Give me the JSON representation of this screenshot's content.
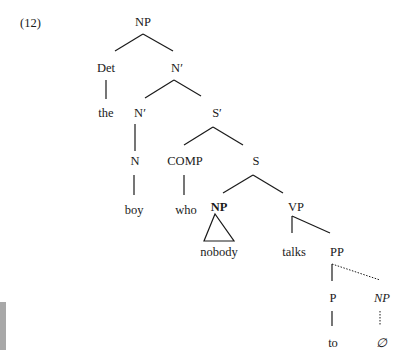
{
  "example_number": "(12)",
  "tree": {
    "root": "NP",
    "nodes": {
      "np_root": "NP",
      "det": "Det",
      "det_word": "the",
      "nbar_top": "N′",
      "nbar_low": "N′",
      "sbar": "S′",
      "n": "N",
      "n_word": "boy",
      "comp": "COMP",
      "comp_word": "who",
      "s": "S",
      "np_subj": "NP",
      "np_subj_word": "nobody",
      "vp": "VP",
      "v_word": "talks",
      "pp": "PP",
      "p": "P",
      "p_word": "to",
      "np_gap": "NP",
      "np_gap_word": "∅"
    },
    "edges": [
      [
        "NP",
        "Det"
      ],
      [
        "NP",
        "N′"
      ],
      [
        "Det",
        "the"
      ],
      [
        "N′",
        "N′"
      ],
      [
        "N′",
        "S′"
      ],
      [
        "N′",
        "N"
      ],
      [
        "N",
        "boy"
      ],
      [
        "S′",
        "COMP"
      ],
      [
        "S′",
        "S"
      ],
      [
        "COMP",
        "who"
      ],
      [
        "S",
        "NP"
      ],
      [
        "S",
        "VP"
      ],
      [
        "NP",
        "nobody (triangle)"
      ],
      [
        "VP",
        "talks"
      ],
      [
        "VP",
        "PP"
      ],
      [
        "PP",
        "P"
      ],
      [
        "PP",
        "NP (dotted)"
      ],
      [
        "P",
        "to"
      ],
      [
        "NP",
        "∅ (dotted)"
      ]
    ]
  }
}
